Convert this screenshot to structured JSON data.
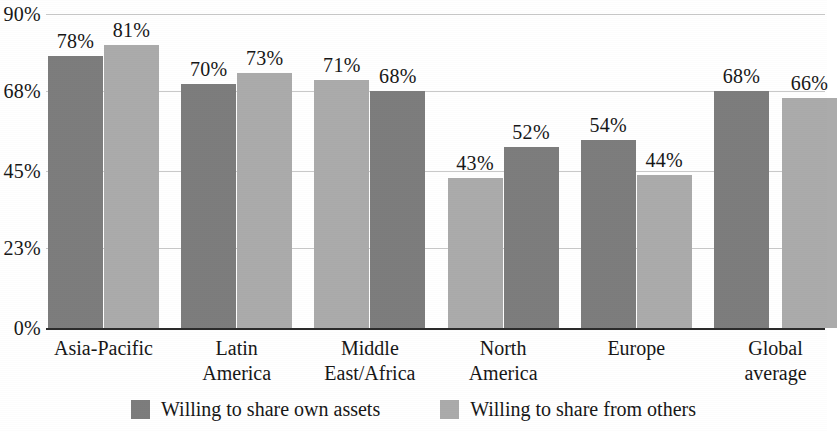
{
  "chart_data": {
    "type": "bar",
    "title": "",
    "subtitle": "",
    "xlabel": "",
    "ylabel": "",
    "ylim": [
      0,
      90
    ],
    "grid": true,
    "legend_position": "bottom",
    "ytick_labels": [
      "90%",
      "68%",
      "45%",
      "23%",
      "0%"
    ],
    "ytick_values": [
      90,
      68,
      45,
      23,
      0
    ],
    "categories": [
      "Asia-Pacific",
      "Latin America",
      "Middle\nEast/Africa",
      "North America",
      "Europe",
      "Global\naverage"
    ],
    "series": [
      {
        "name": "Willing to share own assets",
        "color": "#7d7d7d",
        "values": [
          78,
          70,
          68,
          52,
          54,
          68
        ],
        "value_labels": [
          "78%",
          "70%",
          "68%",
          "52%",
          "54%",
          "68%"
        ]
      },
      {
        "name": "Willing to share from others",
        "color": "#ababab",
        "values": [
          81,
          73,
          71,
          43,
          44,
          66
        ],
        "value_labels": [
          "81%",
          "73%",
          "71%",
          "43%",
          "44%",
          "66%"
        ]
      }
    ],
    "bar_order_in_group": [
      [
        "own",
        "others"
      ],
      [
        "own",
        "others"
      ],
      [
        "others",
        "own"
      ],
      [
        "others",
        "own"
      ],
      [
        "own",
        "others"
      ],
      [
        "own",
        "others"
      ]
    ]
  },
  "legend": {
    "items": [
      {
        "label": "Willing to share own assets",
        "key": "own"
      },
      {
        "label": "Willing to share from others",
        "key": "others"
      }
    ]
  },
  "colors": {
    "series_own": "#7d7d7d",
    "series_others": "#ababab",
    "gridline": "#c9c9c9",
    "axis": "#2b2b2b",
    "text": "#171717",
    "background": "#ffffff"
  }
}
